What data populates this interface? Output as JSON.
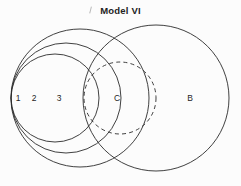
{
  "figure": {
    "title": "Model VI",
    "background_color": "#fcfcfc",
    "stroke_color": "#2b2b2b"
  },
  "chart_data": {
    "type": "diagram",
    "diagram_kind": "venn",
    "title": "Model VI",
    "xlabel": "",
    "ylabel": "",
    "grid": false,
    "legend": "none",
    "categories": [
      "1",
      "2",
      "3",
      "C",
      "B"
    ],
    "values": [
      1,
      2,
      3,
      4,
      5
    ],
    "sets": [
      {
        "label": "1",
        "cx": 55,
        "cy": 98,
        "r": 44,
        "dashed": false,
        "label_x": 18,
        "label_y": 98
      },
      {
        "label": "2",
        "cx": 66,
        "cy": 98,
        "r": 55,
        "dashed": false,
        "label_x": 34,
        "label_y": 98
      },
      {
        "label": "3",
        "cx": 80,
        "cy": 98,
        "r": 69,
        "dashed": false,
        "label_x": 59,
        "label_y": 98
      },
      {
        "label": "C",
        "cx": 120,
        "cy": 98,
        "r": 36,
        "dashed": true,
        "label_x": 117,
        "label_y": 98
      },
      {
        "label": "B",
        "cx": 156,
        "cy": 98,
        "r": 73,
        "dashed": false,
        "label_x": 190,
        "label_y": 98
      }
    ],
    "axis_visible": false,
    "xlim": [
      0,
      241
    ],
    "ylim": [
      0,
      186
    ]
  },
  "labels": {
    "one": "1",
    "two": "2",
    "three": "3",
    "c": "C",
    "b": "B"
  }
}
